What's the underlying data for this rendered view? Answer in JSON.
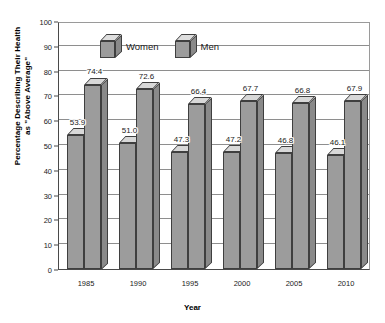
{
  "chart_data": {
    "type": "bar",
    "title": "",
    "xlabel": "Year",
    "ylabel": "Percentage Describing Their Health as \"Above Average\"",
    "ylabel_line1": "Percentage Describing Their Health",
    "ylabel_line2": "as \"Above Average\"",
    "categories": [
      "1985",
      "1990",
      "1995",
      "2000",
      "2005",
      "2010"
    ],
    "series": [
      {
        "name": "Women",
        "values": [
          53.9,
          51.0,
          47.3,
          47.2,
          46.8,
          46.1
        ]
      },
      {
        "name": "Men",
        "values": [
          74.4,
          72.6,
          66.4,
          67.7,
          66.8,
          67.9
        ]
      }
    ],
    "ylim": [
      0,
      100
    ],
    "ytick_step": 10,
    "yticks": [
      0,
      10,
      20,
      30,
      40,
      50,
      60,
      70,
      80,
      90,
      100
    ],
    "ytick_labels": [
      "0",
      "10",
      "20",
      "30",
      "40",
      "50",
      "60",
      "70",
      "80",
      "90",
      "100"
    ],
    "data_labels": [
      [
        "53.9",
        "74.4"
      ],
      [
        "51.0",
        "72.6"
      ],
      [
        "47.3",
        "66.4"
      ],
      [
        "47.2",
        "67.7"
      ],
      [
        "46.8",
        "66.8"
      ],
      [
        "46.1",
        "67.9"
      ]
    ],
    "grid": true,
    "grid_axis": "y",
    "legend_position": "top-center",
    "style": "3d-bar",
    "colors": {
      "bar_front": "#9c9c9c",
      "bar_top": "#d8d8d8",
      "bar_side": "#8a8a8a",
      "bar_edge": "#3f3f3f",
      "gridline": "#8e8e8e",
      "axis": "#4a4a4a",
      "background": "#ffffff",
      "text": "#1a1a1a"
    }
  },
  "legend": {
    "items": [
      {
        "label": "Women",
        "icon": "cube-icon"
      },
      {
        "label": "Men",
        "icon": "cube-icon"
      }
    ]
  }
}
